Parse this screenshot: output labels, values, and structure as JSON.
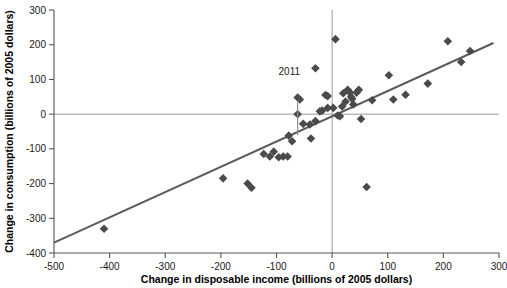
{
  "chart_data": {
    "type": "scatter",
    "title": "",
    "xlabel": "Change in disposable income (billions of 2005 dollars)",
    "ylabel": "Change in consumption (billions of 2005 dollars)",
    "xlim": [
      -500,
      300
    ],
    "ylim": [
      -400,
      300
    ],
    "xticks": [
      -500,
      -400,
      -300,
      -200,
      -100,
      0,
      100,
      200,
      300
    ],
    "yticks": [
      -400,
      -300,
      -200,
      -100,
      0,
      100,
      200,
      300
    ],
    "xtick_labels": [
      "-500",
      "-400",
      "-300",
      "-200",
      "-100",
      "0",
      "100",
      "200",
      "300"
    ],
    "ytick_labels": [
      "-400",
      "-300",
      "-200",
      "-100",
      "0",
      "100",
      "200",
      "300"
    ],
    "grid": false,
    "legend": "none",
    "marker": "diamond",
    "marker_color": "#4a4a4a",
    "line_color": "#5a5a5a",
    "reference_lines": {
      "horizontal_zero": 0,
      "vertical_zero": 0,
      "color": "#9a9a9a"
    },
    "trend_line": {
      "x_start": -500,
      "y_start": -370,
      "x_end": 290,
      "y_end": 205
    },
    "annotations": [
      {
        "text": "2011",
        "x": -62,
        "y": 48,
        "label_x": -77,
        "label_y": 112,
        "leader_from_y": 40,
        "leader_to_y": -60
      }
    ],
    "points": [
      {
        "x": -410,
        "y": -330
      },
      {
        "x": -196,
        "y": -185
      },
      {
        "x": -152,
        "y": -200
      },
      {
        "x": -145,
        "y": -212
      },
      {
        "x": -123,
        "y": -115
      },
      {
        "x": -112,
        "y": -122
      },
      {
        "x": -105,
        "y": -108
      },
      {
        "x": -96,
        "y": -124
      },
      {
        "x": -88,
        "y": -122
      },
      {
        "x": -80,
        "y": -122
      },
      {
        "x": -78,
        "y": -62
      },
      {
        "x": -72,
        "y": -78
      },
      {
        "x": -62,
        "y": 48
      },
      {
        "x": -58,
        "y": 42
      },
      {
        "x": -62,
        "y": 0
      },
      {
        "x": -52,
        "y": -28
      },
      {
        "x": -40,
        "y": -30
      },
      {
        "x": -38,
        "y": -70
      },
      {
        "x": -30,
        "y": 132
      },
      {
        "x": -30,
        "y": -20
      },
      {
        "x": -22,
        "y": 8
      },
      {
        "x": -18,
        "y": 10
      },
      {
        "x": -12,
        "y": 55
      },
      {
        "x": -8,
        "y": 52
      },
      {
        "x": -8,
        "y": 18
      },
      {
        "x": 2,
        "y": 18
      },
      {
        "x": 6,
        "y": 216
      },
      {
        "x": 10,
        "y": -4
      },
      {
        "x": 14,
        "y": -6
      },
      {
        "x": 18,
        "y": 22
      },
      {
        "x": 20,
        "y": 60
      },
      {
        "x": 24,
        "y": 36
      },
      {
        "x": 28,
        "y": 70
      },
      {
        "x": 32,
        "y": 62
      },
      {
        "x": 34,
        "y": 50
      },
      {
        "x": 36,
        "y": 44
      },
      {
        "x": 38,
        "y": 28
      },
      {
        "x": 44,
        "y": 62
      },
      {
        "x": 48,
        "y": 70
      },
      {
        "x": 52,
        "y": -14
      },
      {
        "x": 62,
        "y": -210
      },
      {
        "x": 72,
        "y": 40
      },
      {
        "x": 102,
        "y": 112
      },
      {
        "x": 110,
        "y": 42
      },
      {
        "x": 132,
        "y": 56
      },
      {
        "x": 172,
        "y": 88
      },
      {
        "x": 208,
        "y": 210
      },
      {
        "x": 232,
        "y": 150
      },
      {
        "x": 248,
        "y": 182
      }
    ]
  }
}
